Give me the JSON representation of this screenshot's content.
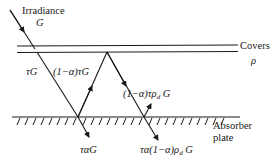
{
  "diagram": {
    "colors": {
      "ink": "#1a1a1a",
      "background": "#ffffff"
    },
    "labels": {
      "irradiance": "Irradiance",
      "irradiance_symbol": "G",
      "covers": "Covers",
      "covers_symbol": "ρ",
      "transmitted": "τG",
      "reflected_first_prefix": "(1−α)τG",
      "reflected_second_prefix": "(1−α)τρ",
      "reflected_second_sub": "d",
      "reflected_second_suffix": " G",
      "absorbed_first": "ταG",
      "absorbed_second_prefix": "τα(1−α)ρ",
      "absorbed_second_sub": "d",
      "absorbed_second_suffix": " G",
      "absorber": "Absorber",
      "plate": "plate"
    },
    "elements": [
      {
        "id": "cover-top",
        "type": "line"
      },
      {
        "id": "cover-bottom",
        "type": "line"
      },
      {
        "id": "absorber-plate",
        "type": "hatched-line"
      },
      {
        "id": "incident-ray",
        "type": "arrow",
        "label": "Irradiance G"
      },
      {
        "id": "transmitted-ray",
        "type": "arrow",
        "label": "τG"
      },
      {
        "id": "reflected-ray-1",
        "type": "arrow",
        "label": "(1−α)τG"
      },
      {
        "id": "reflected-ray-2",
        "type": "arrow",
        "label": "(1−α)τρd G"
      },
      {
        "id": "absorbed-ray-1",
        "type": "arrow",
        "label": "ταG"
      },
      {
        "id": "absorbed-ray-2",
        "type": "arrow",
        "label": "τα(1−α)ρd G"
      }
    ]
  }
}
